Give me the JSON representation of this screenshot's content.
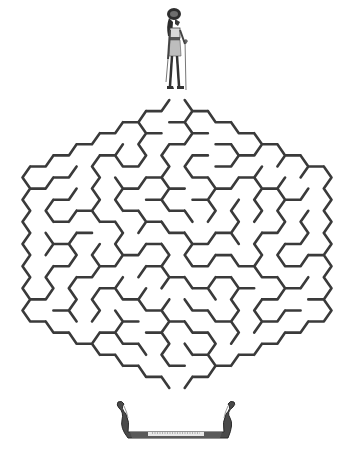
{
  "puzzle": {
    "type": "hexagonal-maze",
    "start_marker": "egyptian-god-figure",
    "goal_marker": "egyptian-boat",
    "wall_color": "#3a3a3a",
    "background_color": "#ffffff",
    "figure_colors": {
      "dark": "#2e2e2e",
      "mid": "#7a7a7a",
      "light": "#cfcfcf"
    },
    "maze": {
      "center_x": 177,
      "top_y": 100,
      "bottom_y": 388,
      "left_x": 23,
      "right_x": 332,
      "seed": 7
    }
  }
}
